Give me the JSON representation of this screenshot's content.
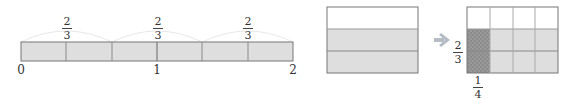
{
  "number_line": {
    "labels": [
      "0",
      "1",
      "2"
    ],
    "segments": [
      {
        "numerator": "2",
        "denominator": "3"
      },
      {
        "numerator": "2",
        "denominator": "3"
      },
      {
        "numerator": "2",
        "denominator": "3"
      }
    ]
  },
  "area_model": {
    "left_rect": {
      "rows": 3,
      "shaded_rows": 2
    },
    "right_rect": {
      "rows": 3,
      "cols": 4,
      "shaded_rows": 2,
      "highlight_cols": 1
    },
    "arrow": "→",
    "row_fraction": {
      "numerator": "2",
      "denominator": "3"
    },
    "col_fraction": {
      "numerator": "1",
      "denominator": "4"
    }
  },
  "colors": {
    "fill": "#dedede",
    "stroke": "#777777",
    "hatch": "#8a8a8a",
    "arrow": "#b5bcc4",
    "arc": "#e6e6e6"
  }
}
